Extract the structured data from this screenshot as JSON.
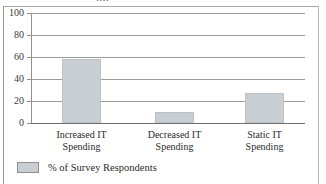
{
  "figure": {
    "title_remnant": "pp",
    "background_color": "#ffffff",
    "frame_color": "#9a9a9a"
  },
  "chart_data": {
    "type": "bar",
    "title": "",
    "xlabel": "",
    "ylabel": "",
    "categories": [
      "Increased IT Spending",
      "Decreased IT Spending",
      "Static IT Spending"
    ],
    "category_lines": [
      [
        "Increased IT",
        "Spending"
      ],
      [
        "Decreased IT",
        "Spending"
      ],
      [
        "Static IT",
        "Spending"
      ]
    ],
    "values": [
      58,
      10,
      27
    ],
    "series": [
      {
        "name": "% of Survey Respondents",
        "values": [
          58,
          10,
          27
        ],
        "color": "#c9ced3"
      }
    ],
    "ylim": [
      0,
      100
    ],
    "yticks": [
      0,
      20,
      40,
      60,
      80,
      100
    ],
    "ytick_labels": [
      "0",
      "20",
      "40",
      "60",
      "80",
      "100"
    ],
    "grid": true,
    "grid_axis": "y",
    "legend_position": "below-left"
  },
  "legend": {
    "entries": [
      {
        "label": "% of Survey Respondents",
        "color": "#c9ced3"
      }
    ]
  }
}
